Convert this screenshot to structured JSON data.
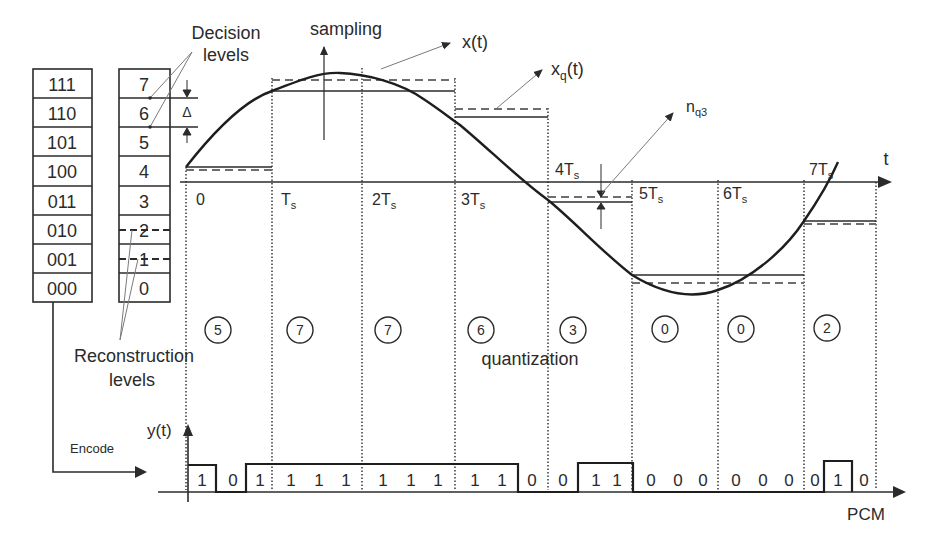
{
  "title_labels": {
    "decision_levels_line1": "Decision",
    "decision_levels_line2": "levels",
    "sampling": "sampling",
    "x_t": "x(t)",
    "xq_t_main": "x",
    "xq_t_sub": "q",
    "xq_t_tail": "(t)",
    "nq3_main": "n",
    "nq3_sub": "q3",
    "t_axis": "t",
    "delta": "Δ",
    "reconstruction_line1": "Reconstruction",
    "reconstruction_line2": "levels",
    "quantization": "quantization",
    "encode": "Encode",
    "y_t": "y(t)",
    "pcm": "PCM"
  },
  "code_table": {
    "codes": [
      "111",
      "110",
      "101",
      "100",
      "011",
      "010",
      "001",
      "000"
    ],
    "levels": [
      "7",
      "6",
      "5",
      "4",
      "3",
      "2",
      "1",
      "0"
    ]
  },
  "time_ticks": [
    {
      "main": "0",
      "sub": ""
    },
    {
      "main": "T",
      "sub": "s"
    },
    {
      "main": "2T",
      "sub": "s"
    },
    {
      "main": "3T",
      "sub": "s"
    },
    {
      "main": "4T",
      "sub": "s"
    },
    {
      "main": "5T",
      "sub": "s"
    },
    {
      "main": "6T",
      "sub": "s"
    },
    {
      "main": "7T",
      "sub": "s"
    }
  ],
  "quantized_samples": [
    "5",
    "7",
    "7",
    "6",
    "3",
    "0",
    "0",
    "2"
  ],
  "pcm_bits": [
    "1",
    "0",
    "1",
    "1",
    "1",
    "1",
    "1",
    "1",
    "1",
    "1",
    "1",
    "0",
    "0",
    "1",
    "1",
    "0",
    "0",
    "0",
    "0",
    "0",
    "0",
    "0",
    "1",
    "0"
  ],
  "colors": {
    "ink": "#2b2b2b",
    "dashed": "#6e6e6e",
    "leader": "#7a7a7a"
  }
}
